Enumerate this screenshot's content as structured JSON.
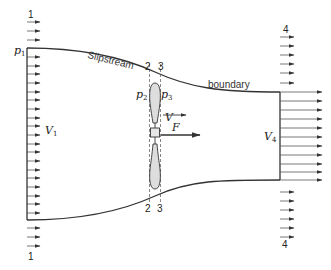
{
  "diagram": {
    "labels": {
      "station1_top": "1",
      "station1_bottom": "1",
      "station4_top": "4",
      "station4_bottom": "4",
      "station2_top": "2",
      "station3_top": "3",
      "station2_bottom": "2",
      "station3_bottom": "3",
      "p1": "p",
      "p1_sub": "1",
      "p2": "p",
      "p2_sub": "2",
      "p3": "p",
      "p3_sub": "3",
      "v1": "V",
      "v1_sub": "1",
      "v4": "V",
      "v4_sub": "4",
      "v": "V",
      "f": "F",
      "slipstream": "Slipstream",
      "boundary": "boundary"
    },
    "colors": {
      "line": "#333333",
      "propeller_fill": "#dddddd",
      "dashed": "#555555"
    }
  }
}
